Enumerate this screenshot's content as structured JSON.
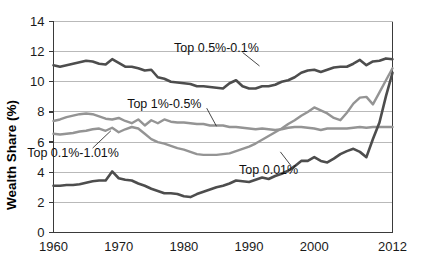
{
  "chart_data": {
    "type": "line",
    "title": "",
    "xlabel": "",
    "ylabel": "Wealth Share (%)",
    "xlim": [
      1960,
      2012
    ],
    "ylim": [
      0,
      14
    ],
    "xticks": [
      1960,
      1970,
      1980,
      1990,
      2000,
      2012
    ],
    "yticks": [
      0,
      2,
      4,
      6,
      8,
      10,
      12,
      14
    ],
    "xticklabels": [
      "1960",
      "1970",
      "1980",
      "1990",
      "2000",
      "2012"
    ],
    "yticklabels": [
      "0",
      "2",
      "4",
      "6",
      "8",
      "10",
      "12",
      "14"
    ],
    "grid": "horizontal",
    "legend": "inline-annotations",
    "x": [
      1960,
      1961,
      1962,
      1963,
      1964,
      1965,
      1966,
      1967,
      1968,
      1969,
      1970,
      1971,
      1972,
      1973,
      1974,
      1975,
      1976,
      1977,
      1978,
      1979,
      1980,
      1981,
      1982,
      1983,
      1984,
      1985,
      1986,
      1987,
      1988,
      1989,
      1990,
      1991,
      1992,
      1993,
      1994,
      1995,
      1996,
      1997,
      1998,
      1999,
      2000,
      2001,
      2002,
      2003,
      2004,
      2005,
      2006,
      2007,
      2008,
      2009,
      2010,
      2011,
      2012
    ],
    "series": [
      {
        "name": "Top 0.5%-0.1%",
        "color": "#4d4d4d",
        "width": 2.6,
        "label_x": 1985,
        "label_y": 12.25,
        "values": [
          11.1,
          11.0,
          11.1,
          11.2,
          11.3,
          11.4,
          11.35,
          11.2,
          11.15,
          11.5,
          11.25,
          11.0,
          11.0,
          10.9,
          10.75,
          10.8,
          10.3,
          10.2,
          10.0,
          9.95,
          9.9,
          9.85,
          9.7,
          9.7,
          9.65,
          9.6,
          9.55,
          9.9,
          10.1,
          9.7,
          9.55,
          9.55,
          9.7,
          9.7,
          9.8,
          10.0,
          10.1,
          10.3,
          10.6,
          10.75,
          10.8,
          10.65,
          10.8,
          10.95,
          11.0,
          11.0,
          11.2,
          11.45,
          11.1,
          11.35,
          11.4,
          11.55,
          11.5
        ]
      },
      {
        "name": "Top 1%-0.5%",
        "color": "#949494",
        "width": 2.4,
        "label_x": 1977,
        "label_y": 8.55,
        "values": [
          7.4,
          7.5,
          7.65,
          7.75,
          7.85,
          7.9,
          7.85,
          7.7,
          7.55,
          7.5,
          7.6,
          7.4,
          7.25,
          7.5,
          7.1,
          7.45,
          7.25,
          7.5,
          7.35,
          7.3,
          7.3,
          7.25,
          7.2,
          7.2,
          7.1,
          7.1,
          7.1,
          7.0,
          7.0,
          6.95,
          6.9,
          6.85,
          6.9,
          6.85,
          6.8,
          6.85,
          6.95,
          7.0,
          7.0,
          6.95,
          6.9,
          6.8,
          6.9,
          6.9,
          6.9,
          6.9,
          6.95,
          7.0,
          6.95,
          7.0,
          7.0,
          7.0,
          7.0
        ]
      },
      {
        "name": "Top 0.1%-1.01%",
        "color": "#949494",
        "width": 2.4,
        "label_x": 1963,
        "label_y": 5.3,
        "values": [
          6.55,
          6.5,
          6.55,
          6.6,
          6.7,
          6.75,
          6.85,
          6.9,
          6.75,
          6.95,
          6.65,
          6.85,
          7.0,
          6.9,
          6.55,
          6.2,
          6.0,
          5.9,
          5.75,
          5.6,
          5.5,
          5.35,
          5.2,
          5.15,
          5.15,
          5.15,
          5.2,
          5.25,
          5.4,
          5.55,
          5.7,
          5.9,
          6.15,
          6.4,
          6.65,
          6.9,
          7.2,
          7.45,
          7.75,
          8.0,
          8.3,
          8.1,
          7.9,
          7.6,
          7.45,
          7.95,
          8.55,
          8.95,
          9.0,
          8.5,
          9.3,
          10.1,
          10.9
        ]
      },
      {
        "name": "Top 0.01%",
        "color": "#4d4d4d",
        "width": 2.6,
        "label_x": 1993,
        "label_y": 4.15,
        "values": [
          3.1,
          3.1,
          3.15,
          3.15,
          3.2,
          3.3,
          3.4,
          3.45,
          3.45,
          4.05,
          3.6,
          3.5,
          3.45,
          3.25,
          3.1,
          2.9,
          2.75,
          2.6,
          2.6,
          2.55,
          2.4,
          2.35,
          2.55,
          2.7,
          2.85,
          3.0,
          3.1,
          3.25,
          3.45,
          3.4,
          3.35,
          3.5,
          3.65,
          3.55,
          3.75,
          3.9,
          4.1,
          4.4,
          4.75,
          4.75,
          5.0,
          4.75,
          4.65,
          4.9,
          5.2,
          5.4,
          5.55,
          5.35,
          5.0,
          6.2,
          7.3,
          9.05,
          10.6
        ]
      }
    ]
  }
}
